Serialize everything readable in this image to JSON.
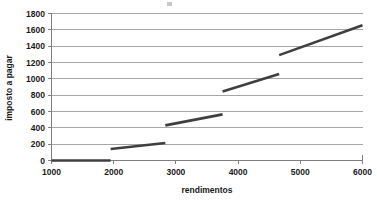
{
  "chart_data": {
    "type": "line",
    "title": "",
    "xlabel": "rendimentos",
    "ylabel": "imposto a pagar",
    "xlim": [
      1000,
      6000
    ],
    "ylim": [
      0,
      1800
    ],
    "xticks": [
      1000,
      2000,
      3000,
      4000,
      5000,
      6000
    ],
    "yticks": [
      0,
      200,
      400,
      600,
      800,
      1000,
      1200,
      1400,
      1600,
      1800
    ],
    "xtick_labels": [
      "1000",
      "2000",
      "3000",
      "4000",
      "5000",
      "6000"
    ],
    "ytick_labels": [
      "0",
      "200",
      "400",
      "600",
      "800",
      "1000",
      "1200",
      "1400",
      "1600",
      "1800"
    ],
    "grid": "horizontal",
    "legend": "none",
    "series": [
      {
        "name": "imposto a pagar",
        "color": "#3f3f3f",
        "style": "piecewise-segments",
        "segments": [
          {
            "bracket": 1,
            "x": [
              1000,
              1950
            ],
            "y": [
              0,
              0
            ]
          },
          {
            "bracket": 2,
            "x": [
              1950,
              2830
            ],
            "y": [
              140,
              215
            ]
          },
          {
            "bracket": 3,
            "x": [
              2830,
              3750
            ],
            "y": [
              430,
              565
            ]
          },
          {
            "bracket": 4,
            "x": [
              3750,
              4660
            ],
            "y": [
              845,
              1060
            ]
          },
          {
            "bracket": 5,
            "x": [
              4660,
              6000
            ],
            "y": [
              1290,
              1655
            ]
          }
        ]
      }
    ]
  },
  "axes": {
    "y_axis_title": "imposto a pagar",
    "x_axis_title": "rendimentos"
  }
}
